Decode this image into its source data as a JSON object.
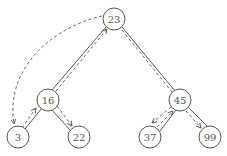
{
  "diagram": {
    "type": "binary-search-tree-traversal",
    "nodes": [
      {
        "id": "n23",
        "label": "23",
        "x": 114,
        "y": 19
      },
      {
        "id": "n16",
        "label": "16",
        "x": 48,
        "y": 100
      },
      {
        "id": "n45",
        "label": "45",
        "x": 180,
        "y": 100
      },
      {
        "id": "n3",
        "label": "3",
        "x": 18,
        "y": 137
      },
      {
        "id": "n22",
        "label": "22",
        "x": 79,
        "y": 137
      },
      {
        "id": "n37",
        "label": "37",
        "x": 150,
        "y": 137
      },
      {
        "id": "n99",
        "label": "99",
        "x": 210,
        "y": 137
      }
    ],
    "edges": [
      [
        "23",
        "16"
      ],
      [
        "23",
        "45"
      ],
      [
        "16",
        "3"
      ],
      [
        "16",
        "22"
      ],
      [
        "45",
        "37"
      ],
      [
        "45",
        "99"
      ]
    ],
    "traversal_arrows": [
      {
        "from": "23",
        "to": "3",
        "style": "dashed-curve"
      },
      {
        "from": "3",
        "to": "16",
        "style": "dashed"
      },
      {
        "from": "16",
        "to": "22",
        "style": "dashed"
      },
      {
        "from": "16",
        "to": "23",
        "style": "dashed"
      },
      {
        "from": "23",
        "to": "45",
        "style": "dashed"
      },
      {
        "from": "45",
        "to": "37",
        "style": "dashed"
      },
      {
        "from": "37",
        "to": "45",
        "style": "dashed"
      },
      {
        "from": "45",
        "to": "99",
        "style": "dashed"
      }
    ]
  }
}
